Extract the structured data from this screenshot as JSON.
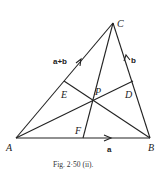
{
  "figure": {
    "caption": "Fig. 2·50 (ii).",
    "points": {
      "A": {
        "label": "A",
        "x": 16,
        "y": 138
      },
      "B": {
        "label": "B",
        "x": 150,
        "y": 138
      },
      "C": {
        "label": "C",
        "x": 113,
        "y": 23
      },
      "D": {
        "label": "D",
        "x": 133,
        "y": 81
      },
      "E": {
        "label": "E",
        "x": 64,
        "y": 81
      },
      "F": {
        "label": "F",
        "x": 83,
        "y": 138
      },
      "P": {
        "label": "P",
        "x": 93,
        "y": 101
      }
    },
    "vectors": {
      "AB": {
        "label": "a"
      },
      "BC": {
        "label": "b"
      },
      "AC": {
        "label": "a+b"
      }
    },
    "segments": [
      "AB",
      "BC",
      "CA",
      "AD",
      "BE",
      "CF"
    ]
  }
}
